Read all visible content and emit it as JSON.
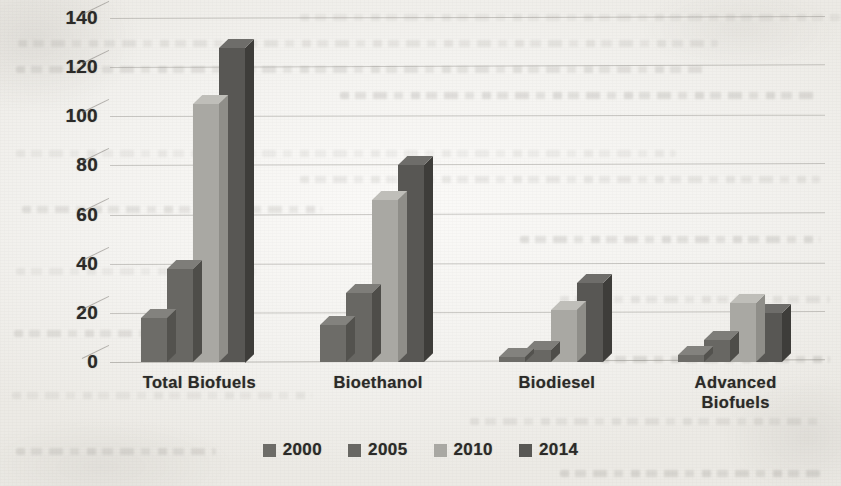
{
  "chart_data": {
    "type": "bar",
    "title": "",
    "subtitle": "",
    "xlabel": "",
    "ylabel": "",
    "categories": [
      "Total Biofuels",
      "Bioethanol",
      "Biodiesel",
      "Advanced Biofuels"
    ],
    "category_lines": [
      [
        "Total Biofuels"
      ],
      [
        "Bioethanol"
      ],
      [
        "Biodiesel"
      ],
      [
        "Advanced",
        "Biofuels"
      ]
    ],
    "series": [
      {
        "name": "2000",
        "color": "#6d6c68",
        "values": [
          18,
          15,
          2,
          3
        ]
      },
      {
        "name": "2005",
        "color": "#686763",
        "values": [
          38,
          28,
          5,
          9
        ]
      },
      {
        "name": "2010",
        "color": "#a9a8a3",
        "values": [
          105,
          66,
          21,
          24
        ]
      },
      {
        "name": "2014",
        "color": "#585754",
        "values": [
          128,
          80,
          32,
          20
        ]
      }
    ],
    "ylim": [
      0,
      140
    ],
    "ytick_values": [
      0,
      20,
      40,
      60,
      80,
      100,
      120,
      140
    ],
    "ytick_labels": [
      "0",
      "20",
      "40",
      "60",
      "80",
      "100",
      "120",
      "140"
    ],
    "grid": true,
    "grid_axis": "y",
    "legend": {
      "position": "bottom",
      "entries": [
        "2000",
        "2005",
        "2010",
        "2014"
      ]
    },
    "style": "3d-clustered-column",
    "render": "scanned-grayscale"
  },
  "colors": {
    "page_background": "#f3f2ef",
    "text": "#2b2a28",
    "gridline": "#807e78"
  }
}
